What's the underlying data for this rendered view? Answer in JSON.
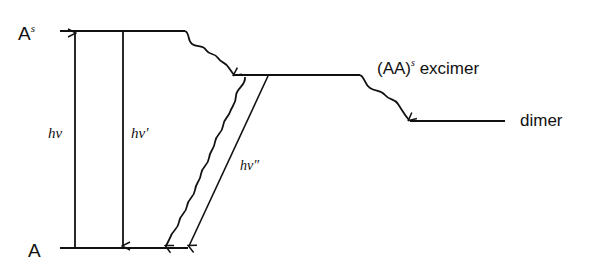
{
  "diagram": {
    "type": "energy-level diagram",
    "levels": {
      "excited_singlet": {
        "label": "A",
        "superscript": "s"
      },
      "ground": {
        "label": "A"
      },
      "excimer": {
        "label_prefix": "(AA)",
        "superscript": "s",
        "label_suffix": " excimer"
      },
      "dimer": {
        "label": "dimer"
      }
    },
    "transitions": {
      "absorption": {
        "label": "hν",
        "style": "straight-arrow-up"
      },
      "monomer_fluorescence": {
        "label": "hν′",
        "style": "straight-arrow-down"
      },
      "excimer_fluorescence": {
        "label": "hν″",
        "style": "straight-arrow-down"
      },
      "excimer_formation": {
        "style": "wavy-arrow"
      },
      "excimer_nonradiative": {
        "style": "wavy-arrow"
      },
      "dimer_formation": {
        "style": "wavy-arrow"
      }
    },
    "colors": {
      "line": "#111111",
      "background": "#ffffff"
    }
  }
}
